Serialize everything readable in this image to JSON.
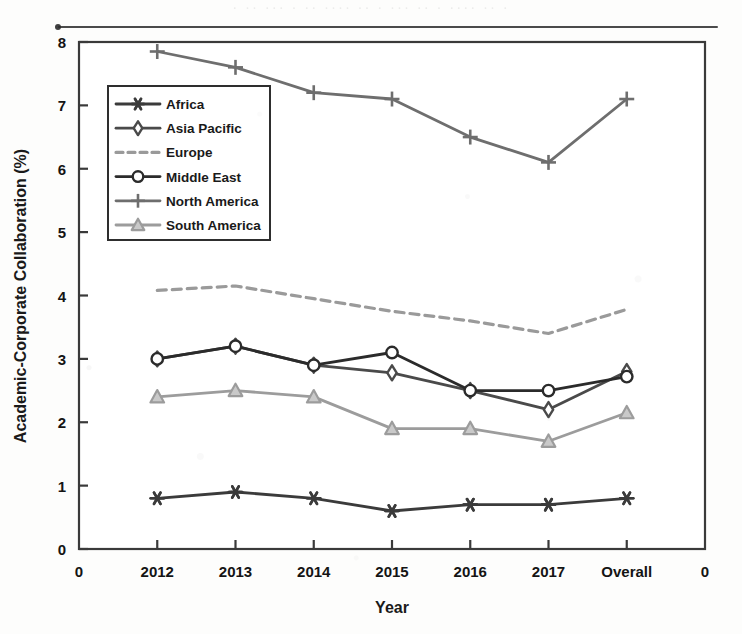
{
  "figure": {
    "background_color": "#fdfdfc",
    "plot_background": "#ffffff",
    "frame_color": "#3a3a3a"
  },
  "chart_data": {
    "type": "line",
    "title": "",
    "xlabel": "Year",
    "ylabel": "Academic-Corporate Collaboration (%)",
    "categories": [
      "2012",
      "2013",
      "2014",
      "2015",
      "2016",
      "2017",
      "Overall"
    ],
    "x_edge_labels": [
      "0",
      "0"
    ],
    "xlim_labels": [
      "0",
      "2012",
      "2013",
      "2014",
      "2015",
      "2016",
      "2017",
      "Overall",
      "0"
    ],
    "ylim": [
      0,
      8
    ],
    "yticks": [
      0,
      1,
      2,
      3,
      4,
      5,
      6,
      7,
      8
    ],
    "ytick_labels": [
      "0",
      "1",
      "2",
      "3",
      "4",
      "5",
      "6",
      "7",
      "8"
    ],
    "grid": false,
    "legend_position": "upper-left-inside",
    "series": [
      {
        "name": "Africa",
        "marker": "asterisk",
        "linestyle": "solid",
        "color": "#3b3b3b",
        "values": [
          0.8,
          0.9,
          0.8,
          0.6,
          0.7,
          0.7,
          0.8
        ]
      },
      {
        "name": "Asia Pacific",
        "marker": "diamond",
        "linestyle": "solid",
        "color": "#4a4a4a",
        "values": [
          3.0,
          3.2,
          2.9,
          2.78,
          2.5,
          2.2,
          2.8
        ]
      },
      {
        "name": "Europe",
        "marker": "none",
        "linestyle": "dashed",
        "color": "#9a9a9a",
        "values": [
          4.08,
          4.15,
          3.95,
          3.75,
          3.6,
          3.4,
          3.78
        ]
      },
      {
        "name": "Middle East",
        "marker": "circle",
        "linestyle": "solid",
        "color": "#2b2b2b",
        "values": [
          3.0,
          3.2,
          2.9,
          3.1,
          2.5,
          2.5,
          2.72
        ]
      },
      {
        "name": "North America",
        "marker": "plus",
        "linestyle": "solid",
        "color": "#6e6e6e",
        "values": [
          7.85,
          7.6,
          7.2,
          7.1,
          6.5,
          6.1,
          7.1
        ]
      },
      {
        "name": "South America",
        "marker": "triangle",
        "linestyle": "solid",
        "color": "#9c9c9c",
        "values": [
          2.4,
          2.5,
          2.4,
          1.9,
          1.9,
          1.7,
          2.15
        ]
      }
    ]
  },
  "scan": {
    "bleed_text": "· ·· ··· · ·· ···· ·· · ··· ·· · ···· ·· ·"
  }
}
